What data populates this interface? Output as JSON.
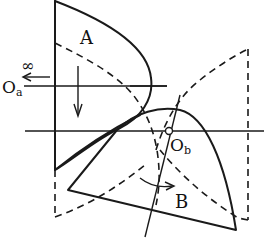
{
  "diagram": {
    "type": "geometric transformation sketch",
    "labels": {
      "region_a": "A",
      "region_b": "B",
      "origin_a": "O",
      "origin_a_sub": "a",
      "origin_b": "O",
      "origin_b_sub": "b",
      "infinity": "∞"
    },
    "colors": {
      "ink": "#1a1a1a",
      "background": "#ffffff"
    },
    "elements": [
      "solid region A bounded by vertical axis and curved arc",
      "dashed mirror of region A",
      "solid region B (curved triangle) below Ob axis",
      "dashed mirror of region B",
      "horizontal axis through Oa",
      "horizontal axis through Ob",
      "inclined line through Ob",
      "downward arrow inside A",
      "curved rotation arrow inside B",
      "leftward arrow with infinity symbol toward Oa"
    ]
  }
}
